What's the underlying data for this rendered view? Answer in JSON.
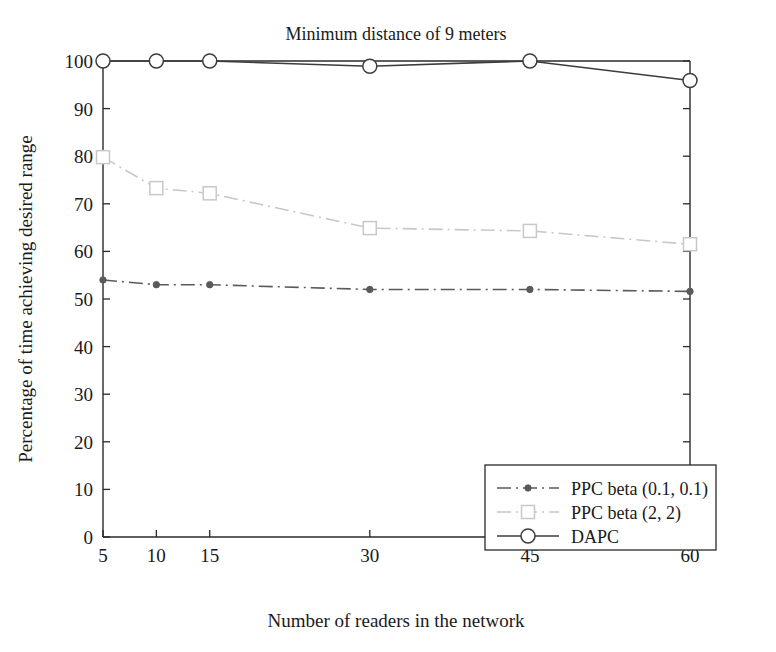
{
  "chart_data": {
    "type": "line",
    "title": "Minimum distance of 9 meters",
    "xlabel": "Number of readers in the network",
    "ylabel": "Percentage of time achieving desired range",
    "x": [
      5,
      10,
      15,
      30,
      45,
      60
    ],
    "xticklabels": [
      "5",
      "10",
      "15",
      "30",
      "45",
      "60"
    ],
    "yticklabels": [
      "0",
      "10",
      "20",
      "30",
      "40",
      "50",
      "60",
      "70",
      "80",
      "90",
      "100"
    ],
    "yticks": [
      0,
      10,
      20,
      30,
      40,
      50,
      60,
      70,
      80,
      90,
      100
    ],
    "xlim": [
      5,
      60
    ],
    "ylim": [
      0,
      100
    ],
    "grid": false,
    "legend_position": "lower right",
    "series": [
      {
        "name": "PPC beta (0.1, 0.1)",
        "values": [
          54.0,
          53.0,
          53.0,
          52.0,
          52.0,
          51.6
        ],
        "color": "#5a5a5a",
        "marker": "dot",
        "linestyle": "dashdot"
      },
      {
        "name": "PPC beta (2, 2)",
        "values": [
          79.8,
          73.3,
          72.2,
          64.9,
          64.3,
          61.5
        ],
        "color": "#c8c8c8",
        "marker": "square",
        "linestyle": "dashdot"
      },
      {
        "name": "DAPC",
        "values": [
          100.0,
          100.0,
          100.0,
          98.9,
          100.0,
          95.9
        ],
        "color": "#3c3c3c",
        "marker": "circle",
        "linestyle": "solid"
      }
    ]
  },
  "legend": {
    "entries": [
      {
        "label": "PPC beta (0.1, 0.1)"
      },
      {
        "label": "PPC beta (2, 2)"
      },
      {
        "label": "DAPC"
      }
    ]
  }
}
